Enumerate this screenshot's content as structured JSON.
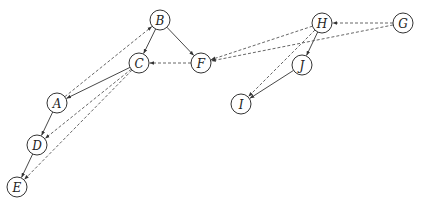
{
  "diagram": {
    "type": "directed-graph",
    "node_radius": 10,
    "colors": {
      "stroke": "#333333",
      "dashed_stroke": "#555555",
      "fill": "#ffffff",
      "text": "#222222"
    },
    "nodes": [
      {
        "id": "A",
        "label": "A",
        "x": 57,
        "y": 103
      },
      {
        "id": "B",
        "label": "B",
        "x": 160,
        "y": 20
      },
      {
        "id": "C",
        "label": "C",
        "x": 139,
        "y": 63
      },
      {
        "id": "D",
        "label": "D",
        "x": 37,
        "y": 145
      },
      {
        "id": "E",
        "label": "E",
        "x": 17,
        "y": 187
      },
      {
        "id": "F",
        "label": "F",
        "x": 201,
        "y": 63
      },
      {
        "id": "G",
        "label": "G",
        "x": 403,
        "y": 23
      },
      {
        "id": "H",
        "label": "H",
        "x": 322,
        "y": 23
      },
      {
        "id": "I",
        "label": "I",
        "x": 241,
        "y": 104
      },
      {
        "id": "J",
        "label": "J",
        "x": 302,
        "y": 65
      }
    ],
    "edges": [
      {
        "from": "B",
        "to": "C",
        "style": "solid"
      },
      {
        "from": "B",
        "to": "F",
        "style": "solid"
      },
      {
        "from": "C",
        "to": "A",
        "style": "solid"
      },
      {
        "from": "A",
        "to": "D",
        "style": "solid"
      },
      {
        "from": "D",
        "to": "E",
        "style": "solid"
      },
      {
        "from": "H",
        "to": "J",
        "style": "solid"
      },
      {
        "from": "J",
        "to": "I",
        "style": "solid"
      },
      {
        "from": "A",
        "to": "B",
        "style": "dashed"
      },
      {
        "from": "F",
        "to": "C",
        "style": "dashed"
      },
      {
        "from": "C",
        "to": "D",
        "style": "dashed"
      },
      {
        "from": "C",
        "to": "E",
        "style": "dashed"
      },
      {
        "from": "G",
        "to": "H",
        "style": "dashed"
      },
      {
        "from": "H",
        "to": "F",
        "style": "dashed"
      },
      {
        "from": "G",
        "to": "F",
        "style": "dashed"
      },
      {
        "from": "H",
        "to": "I",
        "style": "dashed"
      }
    ]
  }
}
